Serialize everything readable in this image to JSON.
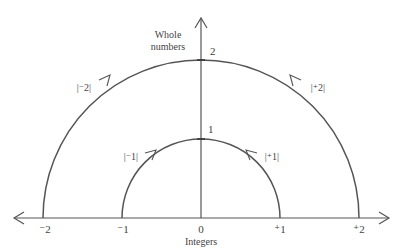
{
  "figure": {
    "vertical_axis_label_line1": "Whole",
    "vertical_axis_label_line2": "numbers",
    "horizontal_axis_label": "Integers",
    "whole_number_ticks": [
      {
        "label": "1",
        "value": 1
      },
      {
        "label": "2",
        "value": 2
      }
    ],
    "integer_ticks": [
      {
        "label": "⁻2",
        "value": -2
      },
      {
        "label": "⁻1",
        "value": -1
      },
      {
        "label": "0",
        "value": 0
      },
      {
        "label": "⁺1",
        "value": 1
      },
      {
        "label": "⁺2",
        "value": 2
      }
    ],
    "arc_labels": {
      "outer_left": "|⁻2|",
      "outer_right": "|⁺2|",
      "inner_left": "|⁻1|",
      "inner_right": "|⁺1|"
    },
    "colors": {
      "line": "#555555",
      "text": "#444444"
    }
  }
}
